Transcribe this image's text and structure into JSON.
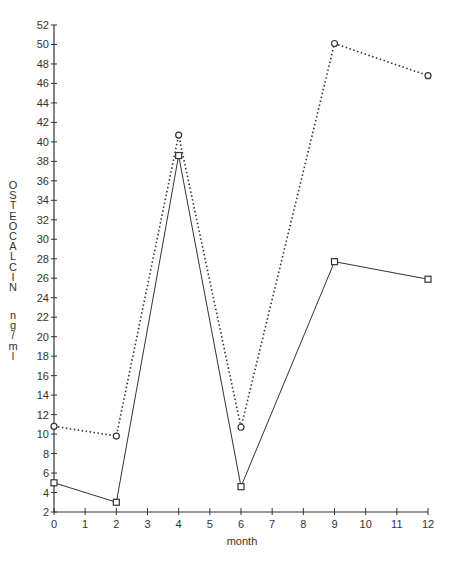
{
  "chart_data": {
    "type": "line",
    "title": "",
    "xlabel": "month",
    "ylabel": "OSTEOCALCIN ng/ml",
    "ylabel_parts": [
      "OSTEOCALCIN",
      "ng/ml"
    ],
    "x": [
      0,
      2,
      4,
      6,
      9,
      12
    ],
    "xlim": [
      0,
      12
    ],
    "ylim": [
      2,
      52
    ],
    "xticks": [
      0,
      1,
      2,
      3,
      4,
      5,
      6,
      7,
      8,
      9,
      10,
      11,
      12
    ],
    "yticks": [
      2,
      4,
      6,
      8,
      10,
      12,
      14,
      16,
      18,
      20,
      22,
      24,
      26,
      28,
      30,
      32,
      34,
      36,
      38,
      40,
      42,
      44,
      46,
      48,
      50,
      52
    ],
    "grid": false,
    "legend": null,
    "series": [
      {
        "name": "circle-dotted",
        "marker": "circle",
        "line_style": "dotted",
        "values": [
          10.8,
          9.8,
          40.7,
          10.7,
          50.1,
          46.8
        ]
      },
      {
        "name": "square-solid",
        "marker": "square",
        "line_style": "solid",
        "values": [
          5.0,
          3.0,
          38.6,
          4.6,
          27.7,
          25.9
        ]
      }
    ]
  },
  "colors": {
    "line": "#333333",
    "axis": "#333333",
    "background": "#ffffff"
  }
}
